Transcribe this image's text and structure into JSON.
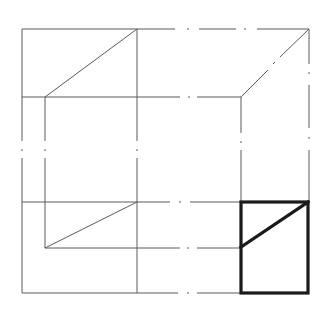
{
  "diagram": {
    "type": "orthographic-projection-construction",
    "views": [
      {
        "name": "top-left-view",
        "style": "thin",
        "shape": "rectangle with diagonal"
      },
      {
        "name": "bottom-left-view",
        "style": "thin",
        "shape": "rectangle with diagonal"
      },
      {
        "name": "bottom-right-result-view",
        "style": "bold",
        "shape": "rectangle with diagonal"
      }
    ],
    "line_styles": {
      "object_lines": "solid thin",
      "projection_lines": "dash-dot (center line)",
      "result_outline": "bold solid"
    },
    "colors": {
      "thin_line": "#5a5a5a",
      "bold_line": "#1a1a1a",
      "background": "#ffffff"
    }
  }
}
